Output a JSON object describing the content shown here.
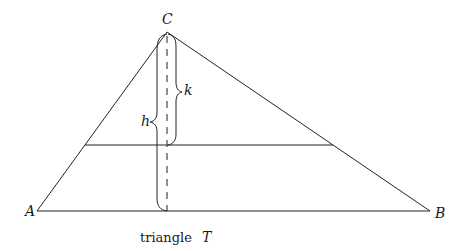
{
  "diagram": {
    "title": "triangle T",
    "caption_prefix": "triangle",
    "caption_var": "T",
    "vertices": {
      "A": {
        "label": "A",
        "x": 37,
        "y": 211
      },
      "B": {
        "label": "B",
        "x": 430,
        "y": 211
      },
      "C": {
        "label": "C",
        "x": 167,
        "y": 32
      }
    },
    "cross_line": {
      "x1": 85,
      "x2": 333,
      "y": 145
    },
    "altitude": {
      "x": 167,
      "y1": 32,
      "y2": 211,
      "style": "dashed"
    },
    "braces": [
      {
        "label": "h",
        "from": "C",
        "to": "base",
        "side": "left"
      },
      {
        "label": "k",
        "from": "C",
        "to": "cross_line",
        "side": "right"
      }
    ],
    "colors": {
      "stroke": "#222222",
      "background": "#ffffff"
    }
  }
}
